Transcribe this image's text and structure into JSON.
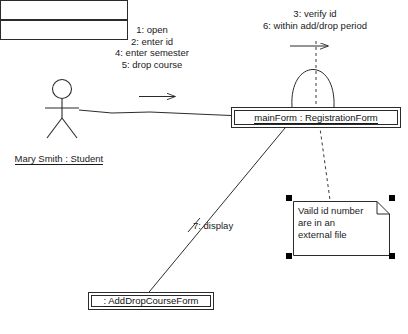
{
  "diagram": {
    "kind": "uml-collaboration-diagram",
    "title": ""
  },
  "actor": {
    "name": "Mary Smith : Student",
    "icon": "stick-figure-actor-icon"
  },
  "objects": [
    {
      "id": "mainform",
      "name": "mainForm : RegistrationForm"
    },
    {
      "id": "adddropcourseform",
      "name": ": AddDropCourseForm",
      "multiobject": true,
      "stack_count": 3
    }
  ],
  "messages": {
    "actor_to_mainform": "1: open\n2: enter id\n4: enter semester\n5: drop course",
    "mainform_self": "3: verify id\n6: within add/drop period",
    "mainform_to_form": "7: display"
  },
  "note": {
    "text": "Vaild id number\nare in an\nexternal file",
    "selected": true,
    "handles": 4
  },
  "colors": {
    "stroke": "#2b2b2b",
    "text": "#1a1a1a",
    "background": "#ffffff",
    "handle": "#000000"
  }
}
